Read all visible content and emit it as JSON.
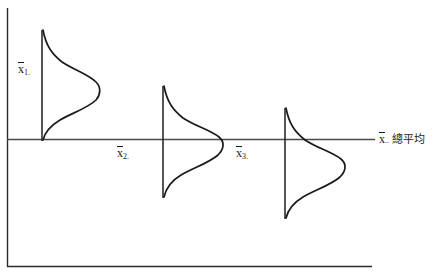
{
  "figure": {
    "type": "anova-between-group-distributions-diagram",
    "background_color": "#ffffff",
    "line_color": "#1a1a1a",
    "frame": {
      "name": "figure-border",
      "left_x": 7,
      "top_y": 8,
      "bottom_y": 267,
      "right_x": 372,
      "visible_sides": "left-and-bottom"
    },
    "axis": {
      "name": "grand-mean-axis",
      "orientation": "horizontal",
      "y": 139,
      "x_start": 7,
      "x_end": 375,
      "label": "x̄.. 總平均",
      "label_math": "x",
      "label_subscript": "..",
      "label_text": "總平均",
      "label_x": 379,
      "label_y": 133
    },
    "groups": [
      {
        "id": "group-1",
        "label_math": "x",
        "label_subscript": "1.",
        "label_full": "x̄1.",
        "label_x": 18,
        "label_y": 63,
        "mean_line_x": 42,
        "mean_line_top_y": 30,
        "mean_line_bottom_y": 141,
        "curve_peak_x": 101,
        "curve_peak_y": 85,
        "curve_center_offset_from_axis": -54,
        "description": "group mean above the grand mean"
      },
      {
        "id": "group-2",
        "label_math": "x",
        "label_subscript": "2.",
        "label_full": "x̄2.",
        "label_x": 117,
        "label_y": 147,
        "mean_line_x": 163,
        "mean_line_top_y": 86,
        "mean_line_bottom_y": 198,
        "curve_peak_x": 225,
        "curve_peak_y": 140,
        "curve_center_offset_from_axis": 1,
        "description": "group mean approximately at the grand mean"
      },
      {
        "id": "group-3",
        "label_math": "x",
        "label_subscript": "3.",
        "label_full": "x̄3.",
        "label_x": 236,
        "label_y": 147,
        "mean_line_x": 285,
        "mean_line_top_y": 108,
        "mean_line_bottom_y": 219,
        "curve_peak_x": 347,
        "curve_peak_y": 168,
        "curve_center_offset_from_axis": 29,
        "description": "group mean below the grand mean"
      }
    ]
  }
}
